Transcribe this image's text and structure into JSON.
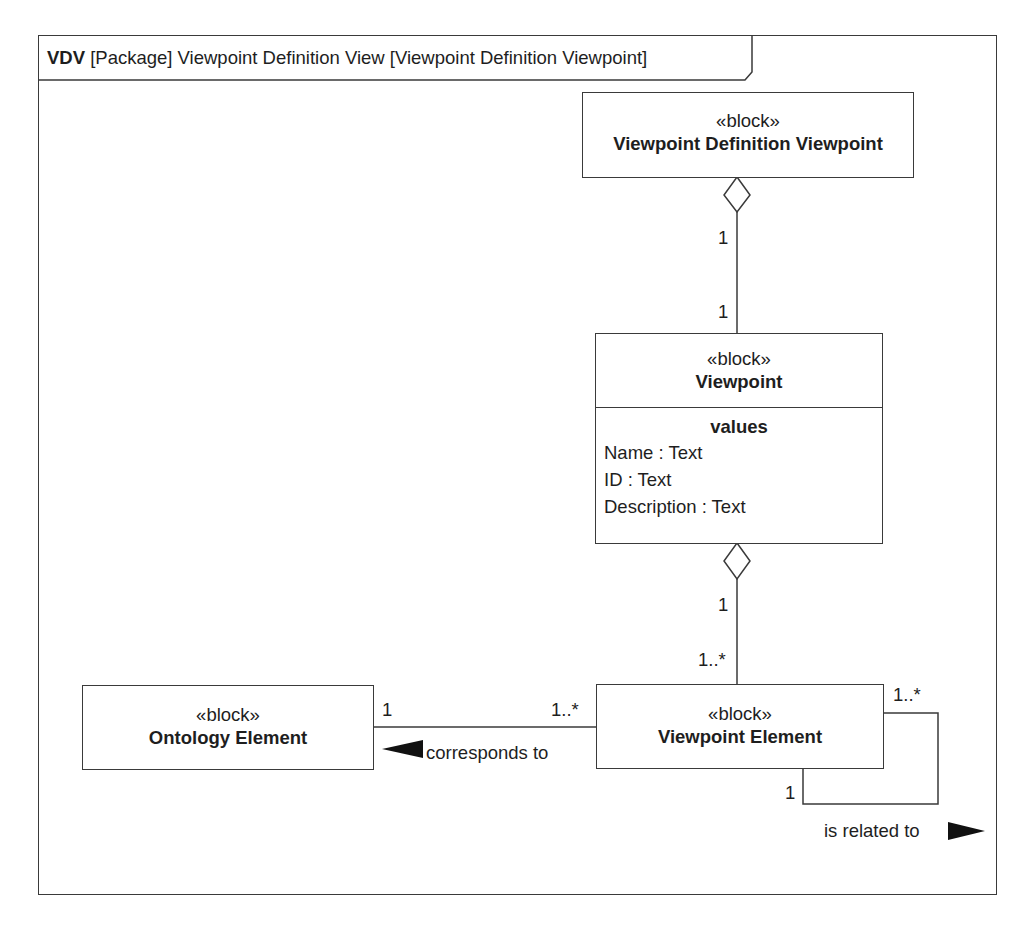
{
  "frame": {
    "keyword": "VDV",
    "title": " [Package] Viewpoint Definition View [Viewpoint Definition Viewpoint]"
  },
  "blocks": {
    "vdv": {
      "stereotype": "«block»",
      "name": "Viewpoint Definition Viewpoint"
    },
    "viewpoint": {
      "stereotype": "«block»",
      "name": "Viewpoint",
      "compartment_title": "values",
      "properties": [
        "Name : Text",
        "ID : Text",
        "Description : Text"
      ]
    },
    "viewpoint_element": {
      "stereotype": "«block»",
      "name": "Viewpoint Element"
    },
    "ontology_element": {
      "stereotype": "«block»",
      "name": "Ontology Element"
    }
  },
  "relationships": {
    "vdv_viewpoint": {
      "type": "aggregation",
      "source_mult": "1",
      "target_mult": "1"
    },
    "viewpoint_element": {
      "type": "aggregation",
      "source_mult": "1",
      "target_mult": "1..*"
    },
    "corresponds_to": {
      "label": "corresponds to",
      "ontology_mult": "1",
      "element_mult": "1..*",
      "direction": "left"
    },
    "is_related_to": {
      "label": "is related to",
      "start_mult": "1..*",
      "end_mult": "1",
      "direction": "right"
    }
  }
}
